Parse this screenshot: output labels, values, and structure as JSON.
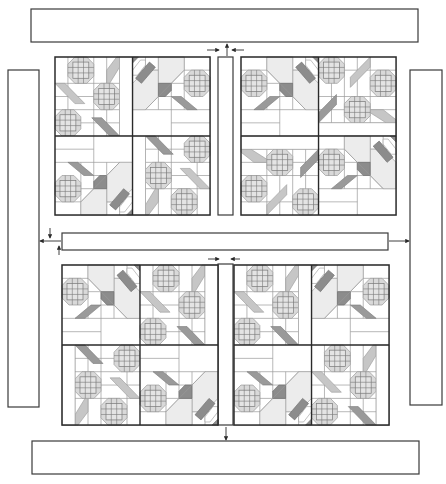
{
  "diagram": {
    "type": "quilt-assembly-diagram",
    "colors": {
      "outline": "#2a2a2a",
      "seam": "#9a9a9a",
      "dark": "#8c8c8c",
      "medium": "#bdbdbd",
      "light": "#d9d9d9",
      "pale": "#ececec",
      "background": "#ffffff"
    },
    "borders": {
      "top": {
        "x": 31,
        "y": 9,
        "w": 387,
        "h": 33
      },
      "bottom": {
        "x": 32,
        "y": 441,
        "w": 387,
        "h": 33
      },
      "left": {
        "x": 8,
        "y": 70,
        "w": 31,
        "h": 337
      },
      "right": {
        "x": 410,
        "y": 70,
        "w": 32,
        "h": 335
      }
    },
    "sashing": {
      "upper_vertical": {
        "x": 218,
        "y": 57,
        "w": 15,
        "h": 158
      },
      "horizontal": {
        "x": 62,
        "y": 233,
        "w": 326,
        "h": 17
      },
      "lower_vertical": {
        "x": 218,
        "y": 264,
        "w": 15,
        "h": 161
      }
    },
    "blocks": [
      {
        "id": "upper-left",
        "x": 55,
        "y": 57,
        "size": 155,
        "quadrants": [
          "A0",
          "B0",
          "B180",
          "A180"
        ]
      },
      {
        "id": "upper-right",
        "x": 241,
        "y": 57,
        "size": 155,
        "quadrants": [
          "A0",
          "A90",
          "B0",
          "B180"
        ]
      },
      {
        "id": "lower-left",
        "x": 62,
        "y": 265,
        "size": 156,
        "quadrants": [
          "B0",
          "A90",
          "A270",
          "B180"
        ]
      },
      {
        "id": "lower-right",
        "x": 234,
        "y": 265,
        "size": 155,
        "quadrants": [
          "A0",
          "B90",
          "B270",
          "A180"
        ]
      }
    ],
    "arrows": [
      {
        "name": "arrow-top-sash-up",
        "from": [
          227,
          56
        ],
        "to": [
          227,
          44
        ]
      },
      {
        "name": "arrow-top-left-in",
        "from": [
          207,
          50
        ],
        "to": [
          219,
          50
        ]
      },
      {
        "name": "arrow-top-right-in",
        "from": [
          244,
          50
        ],
        "to": [
          232,
          50
        ]
      },
      {
        "name": "arrow-left-down",
        "from": [
          50,
          228
        ],
        "to": [
          50,
          238
        ]
      },
      {
        "name": "arrow-left-out",
        "from": [
          61,
          241
        ],
        "to": [
          40,
          241
        ]
      },
      {
        "name": "arrow-left-up",
        "from": [
          59,
          255
        ],
        "to": [
          59,
          246
        ]
      },
      {
        "name": "arrow-right-out",
        "from": [
          389,
          241
        ],
        "to": [
          409,
          241
        ]
      },
      {
        "name": "arrow-mid-left-in",
        "from": [
          208,
          259
        ],
        "to": [
          219,
          259
        ]
      },
      {
        "name": "arrow-mid-right-in",
        "from": [
          240,
          259
        ],
        "to": [
          231,
          259
        ]
      },
      {
        "name": "arrow-bottom-down",
        "from": [
          226,
          427
        ],
        "to": [
          226,
          440
        ]
      }
    ]
  }
}
